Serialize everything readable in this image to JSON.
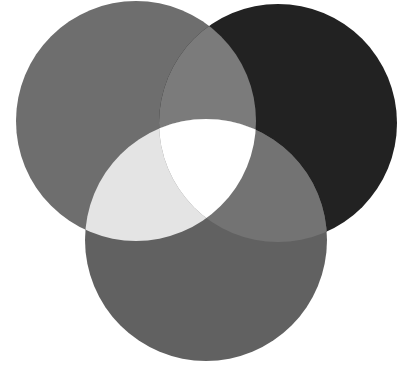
{
  "diagram": {
    "type": "three-circle-venn",
    "background": "#ffffff",
    "circles": [
      {
        "id": "left",
        "cx": 136,
        "cy": 121,
        "r": 120,
        "color": "#6e6e6e"
      },
      {
        "id": "right",
        "cx": 278,
        "cy": 123,
        "r": 119,
        "color": "#222222"
      },
      {
        "id": "bottom",
        "cx": 206,
        "cy": 240,
        "r": 121,
        "color": "#616161"
      }
    ],
    "overlaps": {
      "left_right": "#7b7b7b",
      "left_bottom": "#e4e4e4",
      "right_bottom": "#737373",
      "all_three": "#ffffff"
    }
  }
}
